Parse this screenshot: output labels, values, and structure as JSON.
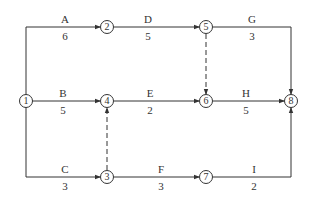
{
  "diagram": {
    "type": "activity-on-arrow network",
    "nodes": [
      {
        "id": "1",
        "label": "1",
        "x": 26,
        "y": 101
      },
      {
        "id": "2",
        "label": "2",
        "x": 107,
        "y": 27
      },
      {
        "id": "3",
        "label": "3",
        "x": 107,
        "y": 177
      },
      {
        "id": "4",
        "label": "4",
        "x": 107,
        "y": 101
      },
      {
        "id": "5",
        "label": "5",
        "x": 206,
        "y": 27
      },
      {
        "id": "6",
        "label": "6",
        "x": 206,
        "y": 101
      },
      {
        "id": "7",
        "label": "7",
        "x": 206,
        "y": 177
      },
      {
        "id": "8",
        "label": "8",
        "x": 291,
        "y": 101
      }
    ],
    "activities": [
      {
        "name": "A",
        "duration": "6",
        "from": "1",
        "to": "2"
      },
      {
        "name": "B",
        "duration": "5",
        "from": "1",
        "to": "4"
      },
      {
        "name": "C",
        "duration": "3",
        "from": "1",
        "to": "3"
      },
      {
        "name": "D",
        "duration": "5",
        "from": "2",
        "to": "5"
      },
      {
        "name": "E",
        "duration": "2",
        "from": "4",
        "to": "6"
      },
      {
        "name": "F",
        "duration": "3",
        "from": "3",
        "to": "7"
      },
      {
        "name": "G",
        "duration": "3",
        "from": "5",
        "to": "8"
      },
      {
        "name": "H",
        "duration": "5",
        "from": "6",
        "to": "8"
      },
      {
        "name": "I",
        "duration": "2",
        "from": "7",
        "to": "8"
      }
    ],
    "dummies": [
      {
        "from": "5",
        "to": "6"
      },
      {
        "from": "3",
        "to": "4"
      }
    ]
  }
}
